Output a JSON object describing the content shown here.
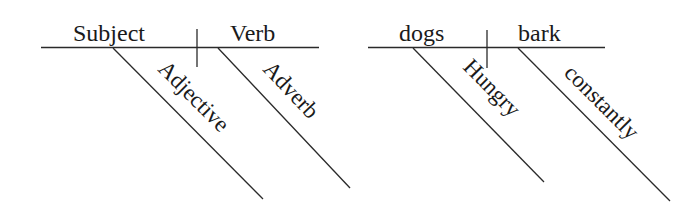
{
  "diagrams": [
    {
      "name": "template",
      "subject": "Subject",
      "verb": "Verb",
      "subject_modifier": "Adjective",
      "verb_modifier": "Adverb"
    },
    {
      "name": "example",
      "subject": "dogs",
      "verb": "bark",
      "subject_modifier": "Hungry",
      "verb_modifier": "constantly"
    }
  ],
  "colors": {
    "background": "#ffffff",
    "ink": "#1a1a1a"
  }
}
